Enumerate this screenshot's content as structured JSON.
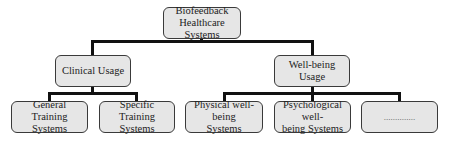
{
  "diagram": {
    "type": "tree",
    "root": {
      "label": "Biofeedback Healthcare Systems",
      "line1": "Biofeedback",
      "line2": "Healthcare Systems"
    },
    "branches": [
      {
        "label": "Clinical Usage",
        "children": [
          {
            "label": "General Training Systems",
            "line1": "General Training",
            "line2": "Systems"
          },
          {
            "label": "Specific Training Systems",
            "line1": "Specific Training",
            "line2": "Systems"
          }
        ]
      },
      {
        "label": "Well-being Usage",
        "children": [
          {
            "label": "Physical well-being Systems",
            "line1": "Physical well-being",
            "line2": "Systems"
          },
          {
            "label": "Psychological well-being Systems",
            "line1": "Psychological well-",
            "line2": "being Systems"
          },
          {
            "label": "..............",
            "line1": "..............",
            "line2": ""
          }
        ]
      }
    ],
    "colors": {
      "node_fill": "#e6e6e6",
      "node_border": "#3a3a3a",
      "connector": "#111111"
    }
  }
}
